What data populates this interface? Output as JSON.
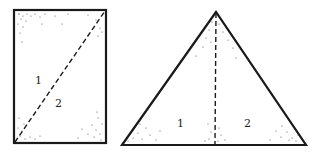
{
  "diagram": {
    "colors": {
      "stroke": "#1a1a1a",
      "background": "#ffffff",
      "stipple": "#555555"
    },
    "rectangle": {
      "corners": {
        "top_left": [
          14,
          10
        ],
        "top_right": [
          106,
          10
        ],
        "bottom_right": [
          106,
          143
        ],
        "bottom_left": [
          14,
          143
        ]
      },
      "divider": {
        "style": "dashed",
        "from": [
          14,
          143
        ],
        "to": [
          106,
          10
        ]
      },
      "regions": [
        {
          "label": "1",
          "pos": [
            38,
            84
          ]
        },
        {
          "label": "2",
          "pos": [
            58,
            107
          ]
        }
      ]
    },
    "triangle": {
      "vertices": {
        "apex": [
          216,
          12
        ],
        "bottom_left": [
          122,
          145
        ],
        "bottom_right": [
          306,
          145
        ]
      },
      "divider": {
        "style": "dashed",
        "from": [
          216,
          12
        ],
        "to": [
          215,
          145
        ]
      },
      "regions": [
        {
          "label": "1",
          "pos": [
            180,
            127
          ]
        },
        {
          "label": "2",
          "pos": [
            247,
            127
          ]
        }
      ]
    }
  }
}
